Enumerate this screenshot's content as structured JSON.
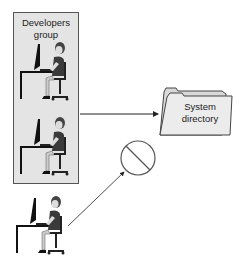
{
  "group": {
    "label_line1": "Developers",
    "label_line2": "group"
  },
  "folder": {
    "label_line1": "System",
    "label_line2": "directory"
  },
  "icons": {
    "person": "person-at-desk-icon",
    "folder": "folder-icon",
    "denied": "prohibited-icon"
  },
  "colors": {
    "group_fill": "#e4e4e4",
    "folder_fill": "#ececec",
    "stroke": "#333333"
  }
}
